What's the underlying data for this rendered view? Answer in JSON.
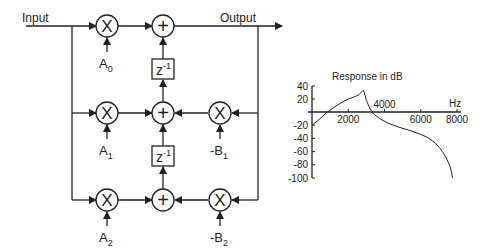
{
  "diagram": {
    "input_label": "Input",
    "output_label": "Output",
    "multiply_symbol": "X",
    "add_symbol": "+",
    "delay_label": "z",
    "delay_exponent": "-1",
    "coefficients": {
      "a0": {
        "base": "A",
        "sub": "0"
      },
      "a1": {
        "base": "A",
        "sub": "1"
      },
      "a2": {
        "base": "A",
        "sub": "2"
      },
      "b1": {
        "base": "-B",
        "sub": "1"
      },
      "b2": {
        "base": "-B",
        "sub": "2"
      }
    },
    "colors": {
      "line": "#222222",
      "background": "#ffffff"
    }
  },
  "chart_data": {
    "type": "line",
    "title": "Response in dB",
    "xlabel": "Hz",
    "ylabel": "",
    "xlim": [
      0,
      8000
    ],
    "ylim": [
      -100,
      40
    ],
    "x_ticks": [
      2000,
      4000,
      6000,
      8000
    ],
    "x_tick_labels": [
      "2000",
      "4000",
      "6000",
      "8000"
    ],
    "y_ticks": [
      40,
      20,
      -20,
      -40,
      -60,
      -80,
      -100
    ],
    "y_tick_labels": [
      "40",
      "20",
      "-20",
      "-40",
      "-60",
      "-80",
      "-100"
    ],
    "grid": false,
    "series": [
      {
        "name": "Response",
        "x": [
          0,
          400,
          800,
          1200,
          1600,
          2000,
          2400,
          2600,
          2800,
          2850,
          3000,
          3200,
          3400,
          3800,
          4200,
          4800,
          5400,
          6000,
          6400,
          6800,
          7000,
          7200,
          7400,
          7600,
          7700,
          7750
        ],
        "y": [
          -20,
          -11,
          -1,
          7,
          14,
          20,
          24,
          27,
          33,
          33,
          18,
          5,
          -3,
          -11,
          -17,
          -23,
          -28,
          -34,
          -39,
          -47,
          -53,
          -60,
          -69,
          -81,
          -92,
          -100
        ]
      }
    ]
  }
}
